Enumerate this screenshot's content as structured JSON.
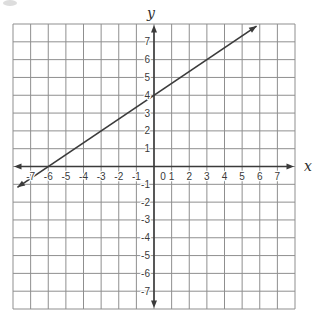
{
  "figure": {
    "width": 317,
    "height": 320,
    "plot": {
      "left": 13,
      "top": 24,
      "right": 295,
      "bottom": 309
    },
    "colors": {
      "background": "#ffffff",
      "grid": "#8f8f8f",
      "axis": "#3b3b3b",
      "line": "#3b3b3b",
      "text": "#3a3a3a"
    }
  },
  "chart_data": {
    "type": "line",
    "title": "",
    "xlabel": "x",
    "ylabel": "y",
    "origin_label": "0",
    "xlim": [
      -8,
      8
    ],
    "ylim": [
      -8,
      8
    ],
    "grid": true,
    "grid_step": 1,
    "x_ticks": [
      -7,
      -6,
      -5,
      -4,
      -3,
      -2,
      -1,
      1,
      2,
      3,
      4,
      5,
      6,
      7
    ],
    "y_ticks": [
      7,
      6,
      5,
      4,
      3,
      2,
      1,
      -1,
      -2,
      -3,
      -4,
      -5,
      -6,
      -7
    ],
    "series": [
      {
        "name": "graphed-line",
        "slope": 0.6667,
        "y_intercept": 4,
        "x": [
          -7.75,
          5.82
        ],
        "y": [
          -1.17,
          7.88
        ],
        "lattice_points": [
          [
            -6,
            0
          ],
          [
            -3,
            2
          ],
          [
            0,
            4
          ],
          [
            3,
            6
          ]
        ],
        "arrow_both_ends": true
      }
    ]
  }
}
